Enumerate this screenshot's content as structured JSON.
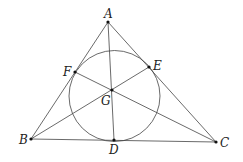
{
  "diagram": {
    "type": "geometry",
    "points": {
      "A": {
        "label": "A",
        "x": 108,
        "y": 22
      },
      "B": {
        "label": "B",
        "x": 31,
        "y": 139
      },
      "C": {
        "label": "C",
        "x": 216,
        "y": 142
      },
      "D": {
        "label": "D",
        "x": 114,
        "y": 140
      },
      "E": {
        "label": "E",
        "x": 149,
        "y": 67
      },
      "F": {
        "label": "F",
        "x": 75,
        "y": 72
      },
      "G": {
        "label": "G",
        "x": 112,
        "y": 90
      }
    },
    "circle": {
      "cx": 114.5,
      "cy": 96,
      "r": 45.5
    },
    "colors": {
      "stroke": "#333333",
      "point": "#111111"
    }
  }
}
